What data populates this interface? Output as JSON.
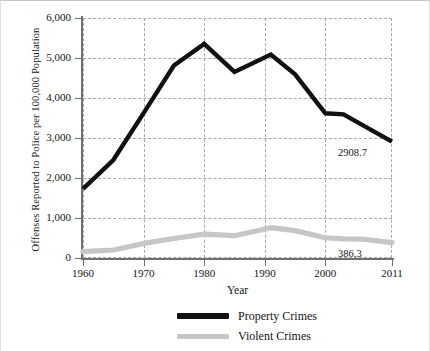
{
  "chart_data": {
    "type": "line",
    "title": "",
    "xlabel": "Year",
    "ylabel": "Offenses Reported to Police per 100,000 Population",
    "xlim": [
      1960,
      2011
    ],
    "ylim": [
      0,
      6000
    ],
    "grid": true,
    "legend_position": "bottom-center",
    "y_ticks": [
      "0",
      "1,000",
      "2,000",
      "3,000",
      "4,000",
      "5,000",
      "6,000"
    ],
    "y_tick_values": [
      0,
      1000,
      2000,
      3000,
      4000,
      5000,
      6000
    ],
    "x_ticks": [
      "1960",
      "1970",
      "1980",
      "1990",
      "2000",
      "2011"
    ],
    "x_tick_values": [
      1960,
      1970,
      1980,
      1990,
      2000,
      2011
    ],
    "series": [
      {
        "name": "Property Crimes",
        "color": "#111111",
        "x": [
          1960,
          1965,
          1970,
          1975,
          1980,
          1985,
          1991,
          1995,
          2000,
          2003,
          2006,
          2011
        ],
        "values": [
          1726,
          2449,
          3621,
          4811,
          5353,
          4651,
          5088,
          4593,
          3618,
          3591,
          3335,
          2908.7
        ],
        "end_label": "2908.7"
      },
      {
        "name": "Violent Crimes",
        "color": "#c6c6c6",
        "x": [
          1960,
          1965,
          1970,
          1975,
          1980,
          1985,
          1991,
          1995,
          2000,
          2003,
          2006,
          2011
        ],
        "values": [
          161,
          200,
          364,
          488,
          597,
          557,
          758,
          685,
          507,
          476,
          474,
          386.3
        ],
        "end_label": "386.3"
      }
    ],
    "annotations": [
      {
        "text": "2908.7",
        "series": "Property Crimes",
        "x": 2011,
        "y": 2908.7
      },
      {
        "text": "386.3",
        "series": "Violent Crimes",
        "x": 2011,
        "y": 386.3
      }
    ]
  },
  "legend": {
    "items": [
      {
        "label": "Property Crimes",
        "color": "#111111"
      },
      {
        "label": "Violent Crimes",
        "color": "#c6c6c6"
      }
    ]
  }
}
